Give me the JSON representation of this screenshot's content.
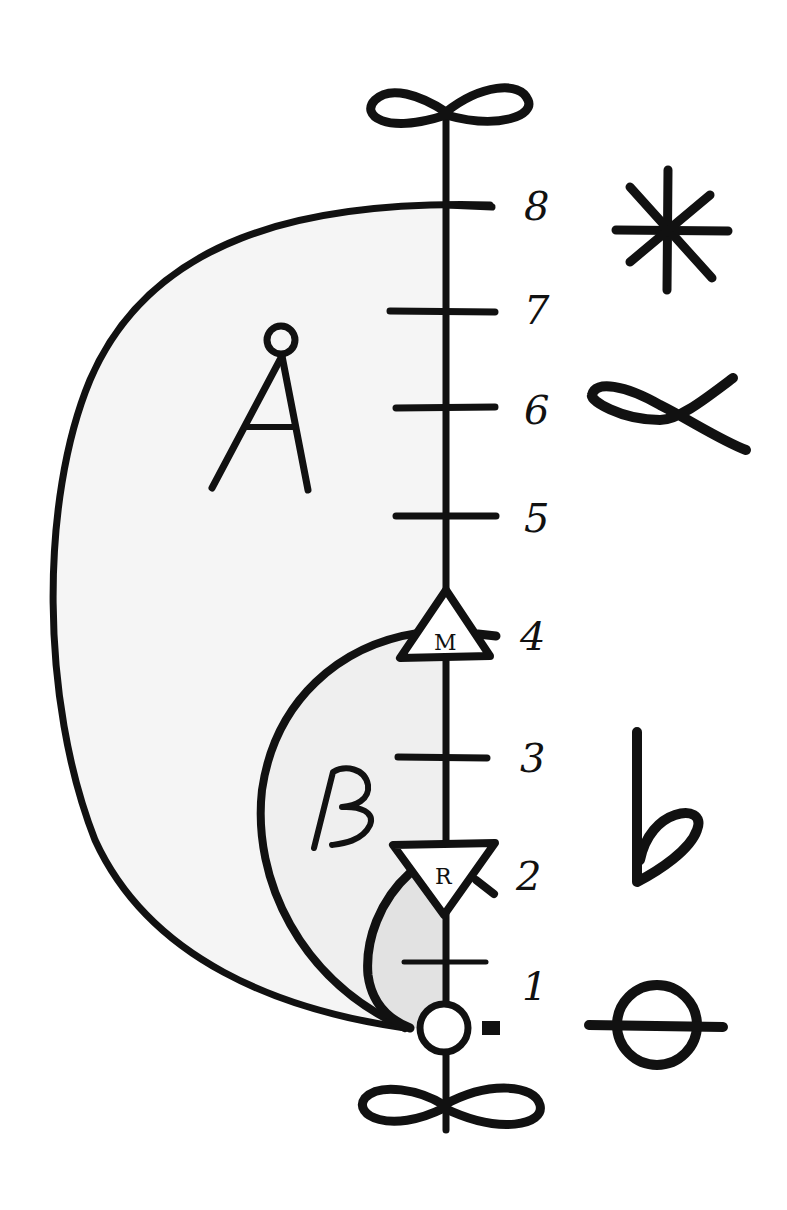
{
  "diagram": {
    "axis": {
      "ticks": [
        {
          "label": "1",
          "y": 962
        },
        {
          "label": "2",
          "y": 878
        },
        {
          "label": "3",
          "y": 758
        },
        {
          "label": "4",
          "y": 634
        },
        {
          "label": "5",
          "y": 517
        },
        {
          "label": "6",
          "y": 410
        },
        {
          "label": "7",
          "y": 311
        },
        {
          "label": "8",
          "y": 204
        }
      ],
      "top_symbol": "infinity-loop-icon",
      "bottom_symbol": "infinity-loop-icon"
    },
    "markers": {
      "m": {
        "letter": "M",
        "shape": "upward-triangle"
      },
      "r": {
        "letter": "R",
        "shape": "downward-triangle"
      },
      "origin": {
        "shape": "circle"
      }
    },
    "regions": {
      "outer": {
        "label": "Å",
        "fill": "#f5f5f5"
      },
      "middle": {
        "label": "β",
        "fill": "#efefef"
      },
      "inner": {
        "label": "",
        "fill": "#e2e2e2"
      }
    },
    "side_symbols": [
      {
        "name": "asterisk",
        "glyph": "✱",
        "level": "8"
      },
      {
        "name": "alpha",
        "glyph": "α",
        "level": "6"
      },
      {
        "name": "flat",
        "glyph": "♭",
        "level": "3-2"
      },
      {
        "name": "theta",
        "glyph": "θ",
        "level": "0"
      }
    ],
    "colors": {
      "ink": "#111111",
      "background": "#ffffff"
    }
  }
}
